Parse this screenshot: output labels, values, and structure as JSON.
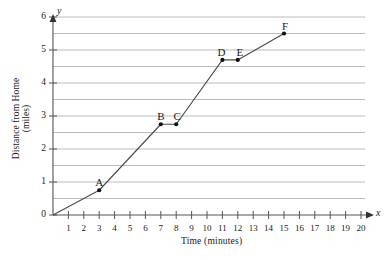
{
  "chart_data": {
    "type": "line",
    "title": "",
    "xlabel": "Time (minutes)",
    "ylabel": "Distance from Home (miles)",
    "ylabel_line1": "Distance from Home",
    "ylabel_line2": "(miles)",
    "x_axis_name": "x",
    "y_axis_name": "y",
    "xlim": [
      0,
      20
    ],
    "ylim": [
      0,
      6
    ],
    "x_ticks": [
      1,
      2,
      3,
      4,
      5,
      6,
      7,
      8,
      9,
      10,
      11,
      12,
      13,
      14,
      15,
      16,
      17,
      18,
      19,
      20
    ],
    "y_ticks": [
      0,
      1,
      2,
      3,
      4,
      5,
      6
    ],
    "gridlines_y": [
      0.5,
      1,
      1.5,
      2,
      2.5,
      3,
      3.5,
      4,
      4.5,
      5,
      5.5,
      6
    ],
    "grid": "horizontal-only",
    "legend": "none",
    "x": [
      0,
      3,
      7,
      8,
      11,
      12,
      15
    ],
    "y": [
      0,
      0.75,
      2.75,
      2.75,
      4.7,
      4.7,
      5.5
    ],
    "points": [
      {
        "label": "A",
        "x": 3,
        "y": 0.75,
        "label_dx": 0,
        "label_dy": -13
      },
      {
        "label": "B",
        "x": 7,
        "y": 2.75,
        "label_dx": 0,
        "label_dy": -13
      },
      {
        "label": "C",
        "x": 8,
        "y": 2.75,
        "label_dx": 1,
        "label_dy": -13
      },
      {
        "label": "D",
        "x": 11,
        "y": 4.7,
        "label_dx": -1,
        "label_dy": -13
      },
      {
        "label": "E",
        "x": 12,
        "y": 4.7,
        "label_dx": 2,
        "label_dy": -13
      },
      {
        "label": "F",
        "x": 15,
        "y": 5.5,
        "label_dx": 1,
        "label_dy": -13
      }
    ],
    "colors": {
      "line": "#4a4a4a",
      "point": "#111111",
      "grid": "#b4b4b4",
      "axis": "#555555",
      "background": "#ffffff"
    }
  }
}
